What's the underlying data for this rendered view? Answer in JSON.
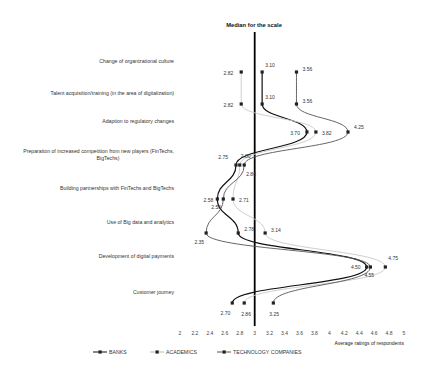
{
  "chart_data": {
    "type": "line",
    "orientation": "horizontal-profile",
    "title": "Median for the scale",
    "xlabel": "Average ratings of respondents",
    "ylabel": "",
    "xlim": [
      2,
      5
    ],
    "x_ticks": [
      "2",
      "2.2",
      "2.4",
      "2.6",
      "2.8",
      "3",
      "3.2",
      "3.4",
      "3.6",
      "3.8",
      "4",
      "4.2",
      "4.4",
      "4.6",
      "4.8",
      "5"
    ],
    "median_value": 3,
    "grid": false,
    "legend_position": "bottom",
    "categories": [
      "Change of organizational culture",
      "Talent acquisition/training (in the area of digitalization)",
      "Adaption to regulatory changes",
      "Preparation of increased competition from new players (FinTechs, BigTechs)",
      "Building partnerships with FinTechs and BigTechs",
      "Use of Big data and analytics",
      "Development of digital payments",
      "Customer journey"
    ],
    "series": [
      {
        "name": "BANKS",
        "color": "#111111",
        "values": [
          3.1,
          3.1,
          3.7,
          2.75,
          2.5,
          2.78,
          4.5,
          2.7
        ]
      },
      {
        "name": "ACADEMICS",
        "color": "#c8c8c8",
        "values": [
          2.82,
          2.82,
          3.82,
          2.8,
          2.71,
          3.14,
          4.75,
          2.86
        ]
      },
      {
        "name": "TECHNOLOGY COMPANIES",
        "color": "#555555",
        "values": [
          3.56,
          3.56,
          4.25,
          2.86,
          2.58,
          2.35,
          4.55,
          3.25
        ]
      }
    ],
    "value_labels": [
      [
        "3.10",
        "2.82",
        "3.56"
      ],
      [
        "3.10",
        "2.82",
        "3.56"
      ],
      [
        "3.70",
        "3.82",
        "4.25"
      ],
      [
        "2.75",
        "2.80",
        "2.86"
      ],
      [
        "2.50",
        "2.71",
        "2.58"
      ],
      [
        "2.78",
        "3.14",
        "2.35"
      ],
      [
        "4.50",
        "4.75",
        "4.55"
      ],
      [
        "2.70",
        "2.86",
        "3.25"
      ]
    ]
  }
}
